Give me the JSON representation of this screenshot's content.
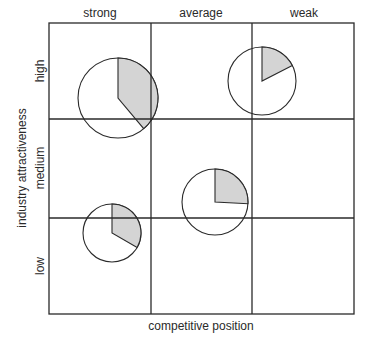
{
  "diagram": {
    "type": "business-portfolio-matrix",
    "x_axis": {
      "label": "competitive position",
      "columns": [
        "strong",
        "average",
        "weak"
      ]
    },
    "y_axis": {
      "label": "industry attractiveness",
      "rows": [
        "high",
        "medium",
        "low"
      ]
    },
    "grid": {
      "left": 49,
      "top": 23,
      "right": 354,
      "bottom": 314,
      "col_lines": [
        151,
        252
      ],
      "row_lines": [
        119,
        218
      ]
    },
    "colors": {
      "line": "#2a2a2a",
      "shade": "#d4d4d4",
      "background": "#ffffff"
    },
    "bubbles": [
      {
        "id": "strong-high",
        "cx": 118,
        "cy": 98,
        "r": 40,
        "shaded_start_deg": 0,
        "shaded_end_deg": 140
      },
      {
        "id": "weak-high",
        "cx": 262,
        "cy": 81,
        "r": 34,
        "shaded_start_deg": 0,
        "shaded_end_deg": 63
      },
      {
        "id": "average-medium",
        "cx": 215,
        "cy": 202,
        "r": 33,
        "shaded_start_deg": 0,
        "shaded_end_deg": 93
      },
      {
        "id": "strong-low",
        "cx": 112,
        "cy": 233,
        "r": 29,
        "shaded_start_deg": 0,
        "shaded_end_deg": 120
      }
    ]
  }
}
